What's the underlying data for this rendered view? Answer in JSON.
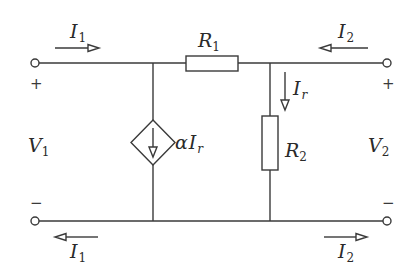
{
  "diagram": {
    "type": "two-port circuit",
    "components": {
      "R1": {
        "symbol": "R",
        "sub": "1",
        "position": "series, top branch"
      },
      "R2": {
        "symbol": "R",
        "sub": "2",
        "position": "shunt, right"
      },
      "dependent_source": {
        "type": "current-controlled current source",
        "prefix": "α",
        "symbol": "I",
        "sub": "r",
        "position": "shunt, left"
      }
    },
    "labels": {
      "I1_top": {
        "symbol": "I",
        "sub": "1"
      },
      "I1_bottom": {
        "symbol": "I",
        "sub": "1"
      },
      "I2_top": {
        "symbol": "I",
        "sub": "2"
      },
      "I2_bottom": {
        "symbol": "I",
        "sub": "2"
      },
      "Ir": {
        "symbol": "I",
        "sub": "r"
      },
      "V1": {
        "symbol": "V",
        "sub": "1"
      },
      "V2": {
        "symbol": "V",
        "sub": "2"
      },
      "R1": {
        "symbol": "R",
        "sub": "1"
      },
      "R2": {
        "symbol": "R",
        "sub": "2"
      },
      "alphaIr": {
        "prefix": "α",
        "symbol": "I",
        "sub": "r"
      }
    },
    "polarity": {
      "plus": "+",
      "minus": "−"
    },
    "colors": {
      "line": "#3a3a3a",
      "text": "#2a2a2a",
      "background": "#ffffff"
    }
  }
}
